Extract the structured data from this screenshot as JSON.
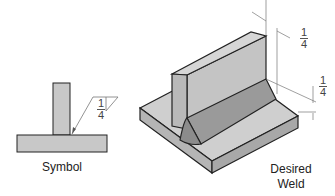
{
  "labels": {
    "symbol": "Symbol",
    "desired_weld_line1": "Desired",
    "desired_weld_line2": "Weld"
  },
  "symbol_dimension": {
    "numerator": "1",
    "denominator": "4"
  },
  "weld_dimensions": {
    "vertical_leg": {
      "numerator": "1",
      "denominator": "4"
    },
    "horizontal_leg": {
      "numerator": "1",
      "denominator": "4"
    }
  },
  "colors": {
    "plate_fill": "#c8c8c8",
    "weld_fill": "#9a9a9a",
    "outline": "#222222",
    "dimension_line": "#777777"
  }
}
